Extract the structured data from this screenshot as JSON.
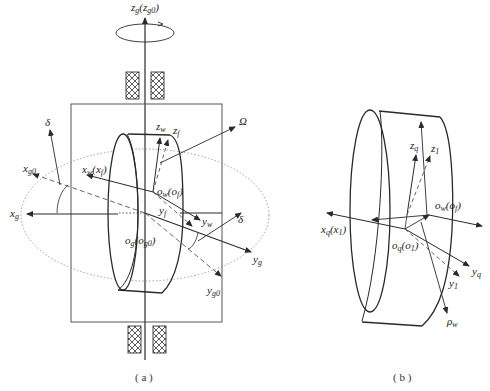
{
  "figure": {
    "panel_a": {
      "caption": "( a )",
      "labels": {
        "zg": {
          "main": "z",
          "sub": "g",
          "paren_main": "z",
          "paren_sub": "g0"
        },
        "delta_left": "δ",
        "xg0": {
          "main": "x",
          "sub": "g0"
        },
        "xg": {
          "main": "x",
          "sub": "g"
        },
        "xw": {
          "main": "x",
          "sub": "w",
          "paren_main": "x",
          "paren_sub": "f"
        },
        "zw": {
          "main": "z",
          "sub": "w"
        },
        "zf": {
          "main": "z",
          "sub": "f"
        },
        "omega": "Ω",
        "ow": {
          "main": "o",
          "sub": "w",
          "paren_main": "o",
          "paren_sub": "f"
        },
        "yf": {
          "main": "y",
          "sub": "f"
        },
        "yw": {
          "main": "y",
          "sub": "w"
        },
        "delta_right": "δ",
        "og": {
          "main": "o",
          "sub": "g",
          "paren_main": "o",
          "paren_sub": "g0"
        },
        "yg": {
          "main": "y",
          "sub": "g"
        },
        "yg0": {
          "main": "y",
          "sub": "g0"
        }
      }
    },
    "panel_b": {
      "caption": "( b )",
      "labels": {
        "zq": {
          "main": "z",
          "sub": "q"
        },
        "z1": {
          "main": "z",
          "sub": "1"
        },
        "ow": {
          "main": "o",
          "sub": "w",
          "paren_main": "o",
          "paren_sub": "f"
        },
        "xq": {
          "main": "x",
          "sub": "q",
          "paren_main": "x",
          "paren_sub": "1"
        },
        "oq": {
          "main": "o",
          "sub": "q",
          "paren_main": "o",
          "paren_sub": "1"
        },
        "yq": {
          "main": "y",
          "sub": "q"
        },
        "y1": {
          "main": "y",
          "sub": "1"
        },
        "rho": {
          "main": "ρ",
          "sub": "w"
        }
      }
    },
    "colors": {
      "line": "#2a2a2a",
      "dashed": "#555555",
      "dotted": "#888888",
      "background": "#ffffff"
    }
  }
}
